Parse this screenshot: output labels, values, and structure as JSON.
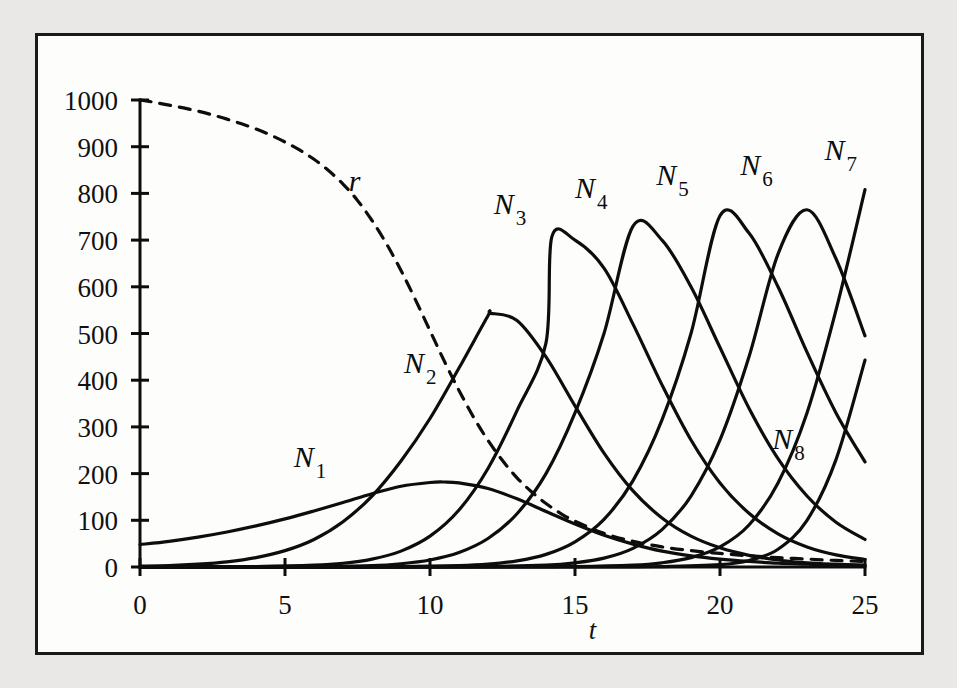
{
  "figure": {
    "background_color": "#fdfdfc",
    "page_background_color": "#e9e8e6",
    "border_color": "#1a1a1a",
    "ink_color": "#0d0d0d"
  },
  "chart_data": {
    "type": "line",
    "title": "",
    "xlabel": "t",
    "ylabel": "",
    "xlim": [
      0,
      25
    ],
    "ylim": [
      0,
      1000
    ],
    "grid": false,
    "legend": "inline-labels",
    "xticks": [
      0,
      5,
      10,
      15,
      20,
      25
    ],
    "xtick_labels": [
      "0",
      "5",
      "10",
      "15",
      "20",
      "25"
    ],
    "yticks": [
      0,
      100,
      200,
      300,
      400,
      500,
      600,
      700,
      800,
      900,
      1000
    ],
    "ytick_labels": [
      "0",
      "100",
      "200",
      "300",
      "400",
      "500",
      "600",
      "700",
      "800",
      "900",
      "1000"
    ],
    "annotations": [
      {
        "text": "N",
        "sub": "1",
        "x": 5.3,
        "y": 215,
        "style": "italic"
      },
      {
        "text": "N",
        "sub": "2",
        "x": 9.1,
        "y": 415,
        "style": "italic"
      },
      {
        "text": "N",
        "sub": "3",
        "x": 12.2,
        "y": 755,
        "style": "italic"
      },
      {
        "text": "N",
        "sub": "4",
        "x": 15.0,
        "y": 790,
        "style": "italic"
      },
      {
        "text": "N",
        "sub": "5",
        "x": 17.8,
        "y": 818,
        "style": "italic"
      },
      {
        "text": "N",
        "sub": "6",
        "x": 20.7,
        "y": 840,
        "style": "italic"
      },
      {
        "text": "N",
        "sub": "7",
        "x": 23.6,
        "y": 872,
        "style": "italic"
      },
      {
        "text": "N",
        "sub": "8",
        "x": 21.8,
        "y": 253,
        "style": "italic"
      },
      {
        "text": "r",
        "sub": "",
        "x": 7.2,
        "y": 805,
        "style": "italic"
      }
    ],
    "series": [
      {
        "name": "r",
        "label": "r",
        "linestyle": "dashed",
        "color": "#0d0d0d",
        "x": [
          0,
          0.5,
          1,
          1.5,
          2,
          2.5,
          3,
          3.5,
          4,
          4.5,
          5,
          5.5,
          6,
          6.5,
          7,
          7.5,
          8,
          8.5,
          9,
          9.5,
          10,
          10.5,
          11,
          11.5,
          12,
          12.5,
          13,
          13.5,
          14,
          14.5,
          15,
          16,
          17,
          18,
          19,
          20,
          21,
          22,
          23,
          24,
          25
        ],
        "y": [
          1000,
          995,
          989,
          983,
          976,
          968,
          959,
          949,
          938,
          925,
          910,
          893,
          873,
          849,
          820,
          785,
          742,
          692,
          635,
          572,
          506,
          440,
          378,
          321,
          271,
          228,
          191,
          161,
          136,
          115,
          98,
          72,
          55,
          43,
          35,
          29,
          24,
          20,
          17,
          14,
          12
        ]
      },
      {
        "name": "N1",
        "label": "N",
        "sub": "1",
        "linestyle": "solid",
        "color": "#0d0d0d",
        "peak_t": 10.5,
        "peak_value": 182,
        "x": [
          0,
          1,
          2,
          3,
          4,
          5,
          6,
          7,
          8,
          9,
          10,
          10.5,
          11,
          12,
          13,
          14,
          15,
          16,
          17,
          18,
          19,
          20,
          21,
          22,
          23,
          24,
          25
        ],
        "y": [
          48,
          55,
          64,
          75,
          88,
          103,
          120,
          138,
          157,
          173,
          181,
          182,
          180,
          168,
          146,
          119,
          92,
          68,
          49,
          34,
          24,
          17,
          12,
          8,
          6,
          4,
          3
        ]
      },
      {
        "name": "N2",
        "label": "N",
        "sub": "2",
        "linestyle": "solid",
        "color": "#0d0d0d",
        "peak_t": 12.1,
        "peak_value": 543,
        "x": [
          0,
          1,
          2,
          3,
          4,
          5,
          6,
          7,
          8,
          9,
          10,
          11,
          12,
          12.1,
          13,
          14,
          15,
          16,
          17,
          18,
          19,
          20,
          21,
          22,
          23,
          24,
          25
        ],
        "y": [
          2,
          3,
          6,
          11,
          20,
          35,
          59,
          97,
          152,
          227,
          318,
          426,
          538,
          543,
          528,
          450,
          345,
          244,
          163,
          105,
          66,
          41,
          25,
          15,
          9,
          6,
          4
        ]
      },
      {
        "name": "N3",
        "label": "N",
        "sub": "3",
        "linestyle": "solid",
        "color": "#0d0d0d",
        "peak_t": 14.2,
        "peak_value": 707,
        "x": [
          0,
          2,
          4,
          6,
          7,
          8,
          9,
          10,
          11,
          12,
          13,
          14,
          14.2,
          15,
          16,
          17,
          18,
          19,
          20,
          21,
          22,
          23,
          24,
          25
        ],
        "y": [
          0,
          0,
          1,
          4,
          8,
          17,
          34,
          66,
          122,
          211,
          335,
          480,
          707,
          700,
          640,
          520,
          390,
          272,
          180,
          115,
          71,
          43,
          26,
          16
        ]
      },
      {
        "name": "N4",
        "label": "N",
        "sub": "4",
        "linestyle": "solid",
        "color": "#0d0d0d",
        "peak_t": 17.0,
        "peak_value": 730,
        "x": [
          0,
          4,
          6,
          8,
          9,
          10,
          11,
          12,
          13,
          14,
          15,
          16,
          17,
          18,
          19,
          20,
          21,
          22,
          23,
          24,
          25
        ],
        "y": [
          0,
          0,
          1,
          3,
          7,
          15,
          31,
          61,
          114,
          200,
          330,
          500,
          730,
          700,
          600,
          470,
          340,
          232,
          152,
          96,
          59
        ]
      },
      {
        "name": "N5",
        "label": "N",
        "sub": "5",
        "linestyle": "solid",
        "color": "#0d0d0d",
        "peak_t": 19.8,
        "peak_value": 752,
        "x": [
          0,
          6,
          9,
          11,
          12,
          13,
          14,
          15,
          16,
          17,
          18,
          19,
          20,
          21,
          22,
          23,
          24,
          25
        ],
        "y": [
          0,
          0,
          1,
          3,
          6,
          13,
          27,
          54,
          102,
          185,
          315,
          500,
          752,
          715,
          600,
          460,
          330,
          225
        ]
      },
      {
        "name": "N6",
        "label": "N",
        "sub": "6",
        "linestyle": "solid",
        "color": "#0d0d0d",
        "peak_t": 22.6,
        "peak_value": 765,
        "x": [
          0,
          9,
          12,
          14,
          15,
          16,
          17,
          18,
          19,
          20,
          21,
          22,
          23,
          24,
          25
        ],
        "y": [
          0,
          0,
          1,
          4,
          9,
          19,
          40,
          80,
          152,
          272,
          450,
          670,
          765,
          660,
          495
        ]
      },
      {
        "name": "N7",
        "label": "N",
        "sub": "7",
        "linestyle": "solid",
        "color": "#0d0d0d",
        "peak_t": 25.0,
        "peak_value": 808,
        "x": [
          0,
          12,
          15,
          17,
          18,
          19,
          20,
          21,
          22,
          23,
          24,
          25
        ],
        "y": [
          0,
          0,
          1,
          4,
          9,
          20,
          43,
          90,
          180,
          330,
          550,
          808
        ]
      },
      {
        "name": "N8",
        "label": "N",
        "sub": "8",
        "linestyle": "solid",
        "color": "#0d0d0d",
        "peak_t": 25.0,
        "peak_value": 443,
        "x": [
          0,
          15,
          18,
          20,
          21,
          22,
          23,
          24,
          25
        ],
        "y": [
          0,
          0,
          1,
          5,
          14,
          38,
          100,
          230,
          443
        ]
      }
    ]
  }
}
